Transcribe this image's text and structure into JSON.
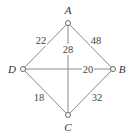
{
  "diagram": {
    "type": "weighted-graph",
    "vertices": [
      {
        "id": "A",
        "label": "A",
        "x": 68,
        "y": 23,
        "label_x": 68,
        "label_y": 14
      },
      {
        "id": "B",
        "label": "B",
        "x": 113,
        "y": 69,
        "label_x": 122,
        "label_y": 73
      },
      {
        "id": "C",
        "label": "C",
        "x": 68,
        "y": 115,
        "label_x": 68,
        "label_y": 131
      },
      {
        "id": "D",
        "label": "D",
        "x": 23,
        "y": 69,
        "label_x": 12,
        "label_y": 73
      }
    ],
    "edges": [
      {
        "from": "A",
        "to": "D",
        "weight": "22",
        "label_x": 41,
        "label_y": 44
      },
      {
        "from": "A",
        "to": "B",
        "weight": "48",
        "label_x": 96,
        "label_y": 44
      },
      {
        "from": "A",
        "to": "C",
        "weight": "28",
        "label_x": 68,
        "label_y": 53
      },
      {
        "from": "D",
        "to": "B",
        "weight": "20",
        "label_x": 88,
        "label_y": 73
      },
      {
        "from": "D",
        "to": "C",
        "weight": "18",
        "label_x": 39,
        "label_y": 101
      },
      {
        "from": "B",
        "to": "C",
        "weight": "32",
        "label_x": 97,
        "label_y": 101
      }
    ]
  }
}
